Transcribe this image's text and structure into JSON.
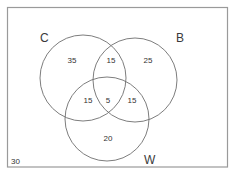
{
  "diagram": {
    "type": "venn-3-set",
    "universe_value": "30",
    "sets": [
      {
        "name": "C",
        "label": "C"
      },
      {
        "name": "B",
        "label": "B"
      },
      {
        "name": "W",
        "label": "W"
      }
    ],
    "regions": {
      "c_only": "35",
      "b_only": "25",
      "w_only": "20",
      "c_and_b_only": "15",
      "c_and_w_only": "15",
      "b_and_w_only": "15",
      "c_and_b_and_w": "5"
    },
    "colors": {
      "border": "#9a9a9a",
      "circle_stroke": "#6e6e6e",
      "text": "#333333"
    }
  }
}
